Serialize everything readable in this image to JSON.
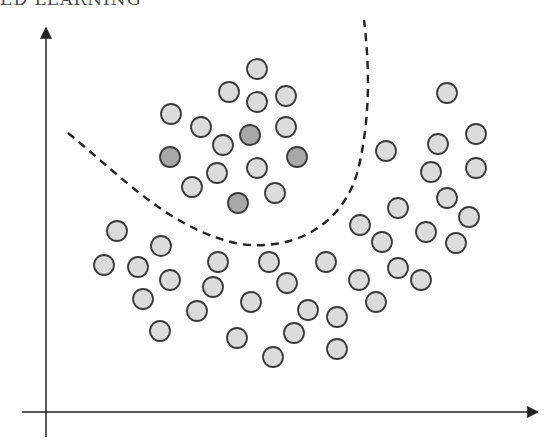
{
  "title": "ED LEARNING",
  "colors": {
    "unlabeled_fill": "#dcdcdc",
    "labeled_fill": "#a8a8a8",
    "stroke": "#3a3a3a",
    "axis": "#222222",
    "boundary": "#222222"
  },
  "axes": {
    "x_axis": {
      "x1": 22,
      "y": 412,
      "x2": 538
    },
    "y_axis": {
      "x": 46,
      "y1": 437,
      "y2": 28
    }
  },
  "decision_boundary": {
    "style": "dashed",
    "path": "M 68 133 C 120 175, 170 230, 240 244 C 300 252, 345 220, 358 170 C 370 120, 370 70, 364 20"
  },
  "points": {
    "radius": 10,
    "labeled": [
      {
        "x": 250,
        "y": 135
      },
      {
        "x": 170,
        "y": 157
      },
      {
        "x": 297,
        "y": 157
      },
      {
        "x": 238,
        "y": 203
      }
    ],
    "unlabeled": [
      {
        "x": 257,
        "y": 69
      },
      {
        "x": 229,
        "y": 92
      },
      {
        "x": 257,
        "y": 102
      },
      {
        "x": 286,
        "y": 96
      },
      {
        "x": 171,
        "y": 114
      },
      {
        "x": 201,
        "y": 127
      },
      {
        "x": 286,
        "y": 127
      },
      {
        "x": 223,
        "y": 145
      },
      {
        "x": 217,
        "y": 173
      },
      {
        "x": 257,
        "y": 168
      },
      {
        "x": 192,
        "y": 187
      },
      {
        "x": 275,
        "y": 193
      },
      {
        "x": 447,
        "y": 93
      },
      {
        "x": 476,
        "y": 134
      },
      {
        "x": 438,
        "y": 144
      },
      {
        "x": 386,
        "y": 151
      },
      {
        "x": 476,
        "y": 168
      },
      {
        "x": 431,
        "y": 172
      },
      {
        "x": 447,
        "y": 198
      },
      {
        "x": 398,
        "y": 208
      },
      {
        "x": 469,
        "y": 217
      },
      {
        "x": 360,
        "y": 225
      },
      {
        "x": 426,
        "y": 232
      },
      {
        "x": 382,
        "y": 242
      },
      {
        "x": 456,
        "y": 243
      },
      {
        "x": 398,
        "y": 268
      },
      {
        "x": 421,
        "y": 280
      },
      {
        "x": 359,
        "y": 280
      },
      {
        "x": 376,
        "y": 302
      },
      {
        "x": 326,
        "y": 262
      },
      {
        "x": 117,
        "y": 231
      },
      {
        "x": 161,
        "y": 246
      },
      {
        "x": 104,
        "y": 265
      },
      {
        "x": 138,
        "y": 267
      },
      {
        "x": 218,
        "y": 262
      },
      {
        "x": 269,
        "y": 262
      },
      {
        "x": 170,
        "y": 280
      },
      {
        "x": 213,
        "y": 287
      },
      {
        "x": 287,
        "y": 283
      },
      {
        "x": 143,
        "y": 299
      },
      {
        "x": 251,
        "y": 302
      },
      {
        "x": 197,
        "y": 311
      },
      {
        "x": 308,
        "y": 310
      },
      {
        "x": 337,
        "y": 317
      },
      {
        "x": 160,
        "y": 331
      },
      {
        "x": 294,
        "y": 333
      },
      {
        "x": 237,
        "y": 338
      },
      {
        "x": 337,
        "y": 349
      },
      {
        "x": 273,
        "y": 357
      }
    ]
  }
}
